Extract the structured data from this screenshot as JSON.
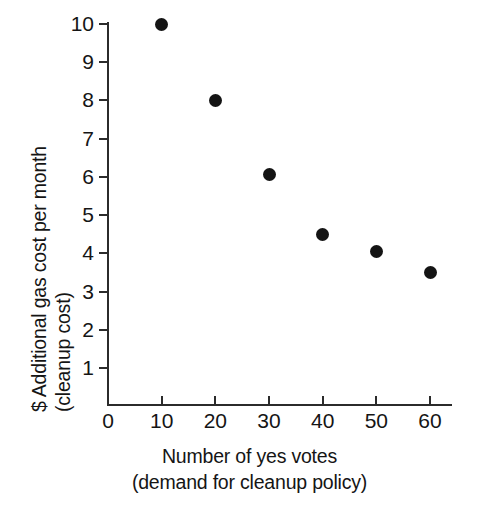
{
  "chart_data": {
    "type": "scatter",
    "title": "",
    "xlabel": "Number of yes votes",
    "xlabel_sub": "(demand for cleanup policy)",
    "ylabel": "$ Additional gas cost per month",
    "ylabel_sub": "(cleanup cost)",
    "x": [
      10,
      20,
      30,
      40,
      50,
      60
    ],
    "values": [
      10.0,
      8.0,
      6.05,
      4.5,
      4.05,
      3.5
    ],
    "series": [
      {
        "name": "cleanup cost vs yes votes",
        "points": [
          {
            "x": 10,
            "y": 10.0
          },
          {
            "x": 20,
            "y": 8.0
          },
          {
            "x": 30,
            "y": 6.05
          },
          {
            "x": 40,
            "y": 4.5
          },
          {
            "x": 50,
            "y": 4.05
          },
          {
            "x": 60,
            "y": 3.5
          }
        ]
      }
    ],
    "xticks": [
      0,
      10,
      20,
      30,
      40,
      50,
      60
    ],
    "yticks": [
      1,
      2,
      3,
      4,
      5,
      6,
      7,
      8,
      9,
      10
    ],
    "xlim": [
      0,
      66
    ],
    "ylim": [
      0,
      10.45
    ],
    "grid": false,
    "legend": false,
    "marker_color": "#141414",
    "axis_color": "#2b2b2b",
    "background": "#ffffff"
  },
  "axis": {
    "x_tick_labels": [
      "0",
      "10",
      "20",
      "30",
      "40",
      "50",
      "60"
    ],
    "y_tick_labels": [
      "1",
      "2",
      "3",
      "4",
      "5",
      "6",
      "7",
      "8",
      "9",
      "10"
    ]
  },
  "labels": {
    "y_line1": "$ Additional gas cost per month",
    "y_line2": "(cleanup cost)",
    "x_line1": "Number of yes votes",
    "x_line2": "(demand for cleanup policy)"
  }
}
